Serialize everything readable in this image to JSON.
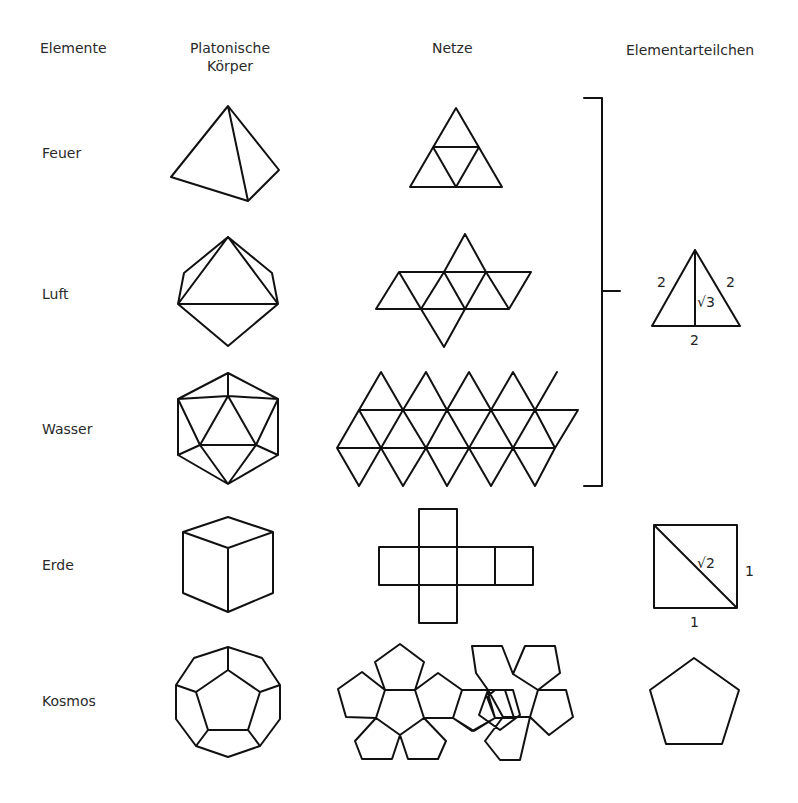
{
  "headers": {
    "elements": "Elemente",
    "solids_line1": "Platonische",
    "solids_line2": "Körper",
    "nets": "Netze",
    "particles": "Elementarteilchen"
  },
  "rows": [
    {
      "element": "Feuer",
      "solid": "tetrahedron",
      "net": "tetrahedron-net"
    },
    {
      "element": "Luft",
      "solid": "octahedron",
      "net": "octahedron-net"
    },
    {
      "element": "Wasser",
      "solid": "icosahedron",
      "net": "icosahedron-net"
    },
    {
      "element": "Erde",
      "solid": "cube",
      "net": "cube-net"
    },
    {
      "element": "Kosmos",
      "solid": "dodecahedron",
      "net": "dodecahedron-net"
    }
  ],
  "particles": {
    "triangle": {
      "side_left": "2",
      "side_right": "2",
      "base": "2",
      "height": "√3"
    },
    "square": {
      "diagonal": "√2",
      "side_right": "1",
      "base": "1"
    },
    "pentagon": {}
  },
  "colors": {
    "stroke": "#111111",
    "text": "#2a2a2a",
    "background": "#ffffff"
  }
}
